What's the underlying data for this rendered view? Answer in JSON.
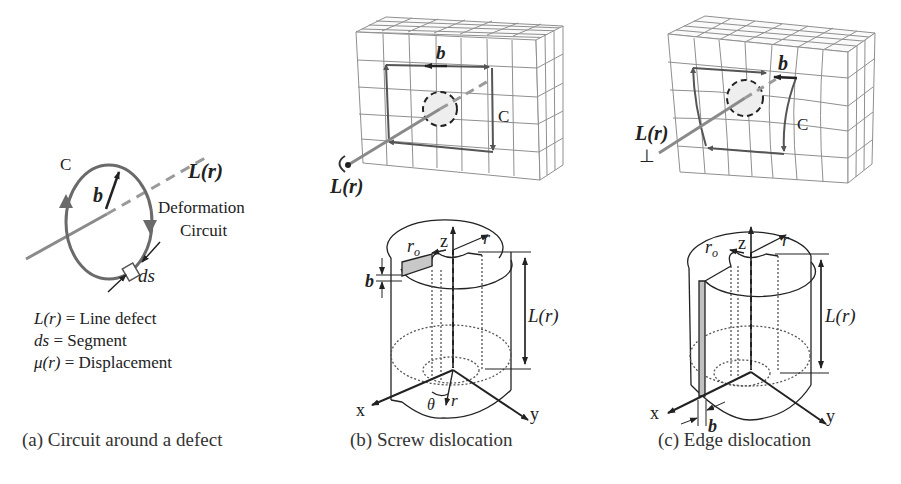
{
  "panels": {
    "a": {
      "caption": "(a) Circuit around a defect",
      "circuit_label": "C",
      "burgers_label": "b",
      "line_label": "L(r)",
      "deformation_label_1": "Deformation",
      "deformation_label_2": "Circuit",
      "segment_label": "ds",
      "legend": [
        {
          "symbol": "L(r)",
          "eq": " = Line defect"
        },
        {
          "symbol": "ds",
          "eq": " = Segment"
        },
        {
          "symbol": "μ(r)",
          "eq": " = Displacement"
        }
      ]
    },
    "b": {
      "caption": "(b) Screw dislocation",
      "lattice": {
        "burgers_label": "b",
        "circuit_label": "C",
        "line_label": "L(r)"
      },
      "cylinder": {
        "z_label": "z",
        "x_label": "x",
        "y_label": "y",
        "r0_label": "r",
        "r0_sub": "o",
        "r_label": "r",
        "b_label": "b",
        "length_label": "L(r)",
        "theta_label": "θ",
        "r_bottom_label": "r"
      }
    },
    "c": {
      "caption": "(c) Edge dislocation",
      "lattice": {
        "burgers_label": "b",
        "circuit_label": "C",
        "line_label": "L(r)",
        "symbol": "⊥"
      },
      "cylinder": {
        "z_label": "z",
        "x_label": "x",
        "y_label": "y",
        "r0_label": "r",
        "r0_sub": "o",
        "r_label": "r",
        "b_label": "b",
        "length_label": "L(r)"
      }
    }
  },
  "colors": {
    "line": "#222222",
    "gray_line": "#8a8a8a",
    "circuit": "#666666",
    "grid": "#8f8f8f",
    "shade": "#c8c8c8"
  }
}
